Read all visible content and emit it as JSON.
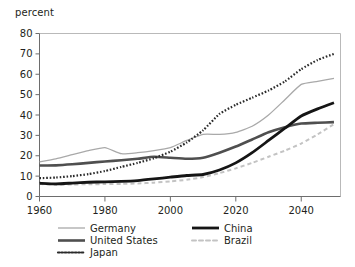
{
  "chart_data": {
    "type": "line",
    "title": "",
    "subtitle": "",
    "xlabel": "",
    "ylabel": "percent",
    "ylim": [
      0,
      80
    ],
    "xlim": [
      1960,
      2052
    ],
    "grid": false,
    "legend_position": "bottom",
    "yticks": [
      0,
      10,
      20,
      30,
      40,
      50,
      60,
      70,
      80
    ],
    "ytick_labels": [
      "0",
      "10",
      "20",
      "30",
      "40",
      "50",
      "60",
      "70",
      "80"
    ],
    "xticks": [
      1960,
      1980,
      2000,
      2020,
      2040
    ],
    "xtick_labels": [
      "1960",
      "1980",
      "2000",
      "2020",
      "2040"
    ],
    "x": [
      1960,
      1965,
      1970,
      1975,
      1980,
      1985,
      1990,
      1995,
      2000,
      2005,
      2010,
      2015,
      2020,
      2025,
      2030,
      2035,
      2040,
      2045,
      2050
    ],
    "series": [
      {
        "name": "Germany",
        "color": "#a9a9a9",
        "style": "solid",
        "width": 1.3,
        "values": [
          17.0,
          18.5,
          20.5,
          22.5,
          24.0,
          21.0,
          21.5,
          22.5,
          24.0,
          27.5,
          30.5,
          30.5,
          31.5,
          34.5,
          40.0,
          47.5,
          55.0,
          56.5,
          58.0
        ]
      },
      {
        "name": "United States",
        "color": "#4f4f4f",
        "style": "solid",
        "width": 2.6,
        "values": [
          15.2,
          15.3,
          15.8,
          16.5,
          17.2,
          17.8,
          18.5,
          19.5,
          19.0,
          18.5,
          19.0,
          21.5,
          24.5,
          28.0,
          31.5,
          34.0,
          35.8,
          36.2,
          36.5
        ]
      },
      {
        "name": "Japan",
        "color": "#2a2a2a",
        "style": "dotted",
        "width": 2.2,
        "values": [
          9.0,
          9.3,
          10.0,
          11.0,
          12.5,
          14.5,
          16.5,
          18.8,
          22.0,
          26.5,
          32.5,
          40.5,
          45.0,
          48.5,
          52.0,
          56.5,
          62.5,
          67.0,
          70.0
        ]
      },
      {
        "name": "China",
        "color": "#151515",
        "style": "solid",
        "width": 2.8,
        "values": [
          6.5,
          6.2,
          6.6,
          7.0,
          7.2,
          7.4,
          7.8,
          8.6,
          9.5,
          10.3,
          10.8,
          13.0,
          16.5,
          21.5,
          27.5,
          33.5,
          39.5,
          43.0,
          46.0
        ]
      },
      {
        "name": "Brazil",
        "color": "#c3c3c3",
        "style": "dashed",
        "width": 2.0,
        "values": [
          6.2,
          5.7,
          5.9,
          6.0,
          6.1,
          6.2,
          6.4,
          6.8,
          7.4,
          8.2,
          9.5,
          11.5,
          13.8,
          16.5,
          19.5,
          22.5,
          26.0,
          30.5,
          35.5
        ]
      }
    ],
    "legend": [
      {
        "label": "Germany",
        "color": "#a9a9a9",
        "style": "solid",
        "width": 1.3
      },
      {
        "label": "United States",
        "color": "#4f4f4f",
        "style": "solid",
        "width": 2.6
      },
      {
        "label": "Japan",
        "color": "#2a2a2a",
        "style": "dotted",
        "width": 2.2
      },
      {
        "label": "China",
        "color": "#151515",
        "style": "solid",
        "width": 2.8
      },
      {
        "label": "Brazil",
        "color": "#c3c3c3",
        "style": "dashed",
        "width": 2.0
      }
    ]
  }
}
